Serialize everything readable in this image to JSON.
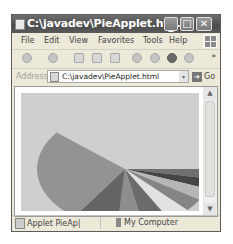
{
  "window": {
    "title": "C:\\javadev\\PieApplet.ht...",
    "controls": {
      "minimize": "_",
      "maximize": "□",
      "close": "✕"
    }
  },
  "menubar": {
    "items": [
      {
        "label": "File"
      },
      {
        "label": "Edit"
      },
      {
        "label": "View"
      },
      {
        "label": "Favorites"
      },
      {
        "label": "Tools"
      },
      {
        "label": "Help"
      }
    ]
  },
  "toolbar": {
    "buttons": [
      "back-icon",
      "forward-icon",
      "stop-icon",
      "refresh-icon",
      "home-icon",
      "search-icon",
      "favorites-icon",
      "media-icon",
      "history-icon"
    ],
    "overflow": "»"
  },
  "addressbar": {
    "label": "Address",
    "value": "C:\\javadev\\PieApplet.html",
    "dropdown": "▾",
    "go_label": "Go",
    "go_arrow": "➔"
  },
  "scrollbar": {
    "up": "▲",
    "down": "▼"
  },
  "statusbar": {
    "left_text": "Applet PieAp|",
    "right_text": "My Computer"
  },
  "applet": {
    "background": "#cfcfcf",
    "pie": {
      "cx": 104,
      "cy": 76,
      "rx": 88,
      "ry": 58,
      "slices": [
        {
          "start": 0,
          "end": 10,
          "color": "#707070"
        },
        {
          "start": 10,
          "end": 20,
          "color": "#454545"
        },
        {
          "start": 20,
          "end": 32,
          "color": "#b6b6b6"
        },
        {
          "start": 32,
          "end": 45,
          "color": "#858585"
        },
        {
          "start": 45,
          "end": 60,
          "color": "#e2e2e2"
        },
        {
          "start": 60,
          "end": 78,
          "color": "#6b6b6b"
        },
        {
          "start": 78,
          "end": 95,
          "color": "#8d8d8d"
        },
        {
          "start": 95,
          "end": 125,
          "color": "#656565"
        },
        {
          "start": 125,
          "end": 219,
          "color": "#939393"
        }
      ]
    }
  }
}
